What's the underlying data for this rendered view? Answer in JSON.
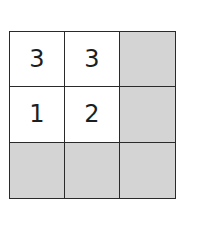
{
  "puzzle": {
    "rows": 3,
    "cols": 3,
    "cells": [
      [
        {
          "value": "3",
          "shaded": false
        },
        {
          "value": "3",
          "shaded": false
        },
        {
          "value": "",
          "shaded": true
        }
      ],
      [
        {
          "value": "1",
          "shaded": false
        },
        {
          "value": "2",
          "shaded": false
        },
        {
          "value": "",
          "shaded": true
        }
      ],
      [
        {
          "value": "",
          "shaded": true
        },
        {
          "value": "",
          "shaded": true
        },
        {
          "value": "",
          "shaded": true
        }
      ]
    ]
  },
  "colors": {
    "shaded": "#d4d4d4",
    "line": "#2a2a2a",
    "text": "#1e1e1e"
  }
}
